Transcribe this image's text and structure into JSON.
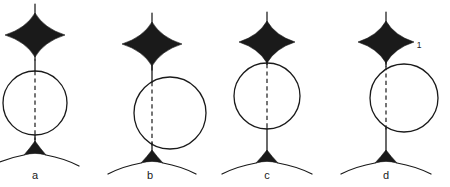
{
  "figure": {
    "background_color": "#ffffff",
    "ink_color": "#1a1a1a",
    "width": 450,
    "height": 187,
    "panel_count": 4
  },
  "panels": [
    {
      "id": "panel-a",
      "label": "a",
      "label_x": 35,
      "label_y": 179,
      "axis_x": 35,
      "star": {
        "name": "four-pointed-star",
        "center_x": 35,
        "center_y": 35,
        "h_radius": 30,
        "v_radius": 22,
        "tail_top_y": 4,
        "tail_bottom_y": 60
      },
      "circle": {
        "name": "circle",
        "center_x": 35,
        "center_y": 103,
        "radius": 32,
        "offset_from_axis": 0
      },
      "dashed_chord": {
        "x": 35,
        "y_top": 71,
        "y_bottom": 140
      },
      "stem_upper": {
        "x": 35,
        "y_top": 60,
        "y_bottom": 71
      },
      "stem_lower": {
        "x": 35,
        "y_top": 135,
        "y_bottom": 143
      },
      "tripod": {
        "name": "tripod-foot",
        "apex_x": 35,
        "apex_y": 141,
        "base_y": 155,
        "base_half_width": 11,
        "wing_span": 33,
        "wing_drop": 11
      },
      "mark": null
    },
    {
      "id": "panel-b",
      "label": "b",
      "label_x": 150,
      "label_y": 179,
      "axis_x": 152,
      "star": {
        "name": "four-pointed-star",
        "center_x": 152,
        "center_y": 44,
        "h_radius": 30,
        "v_radius": 22,
        "tail_top_y": 13,
        "tail_bottom_y": 70
      },
      "circle": {
        "name": "circle",
        "center_x": 170,
        "center_y": 113,
        "radius": 36,
        "offset_from_axis": 18
      },
      "dashed_chord": {
        "x": 152,
        "y_top": 82,
        "y_bottom": 148
      },
      "stem_upper": {
        "x": 152,
        "y_top": 66,
        "y_bottom": 82
      },
      "stem_lower": {
        "x": 152,
        "y_top": 143,
        "y_bottom": 152
      },
      "tripod": {
        "name": "tripod-foot",
        "apex_x": 152,
        "apex_y": 150,
        "base_y": 163,
        "base_half_width": 11,
        "wing_span": 33,
        "wing_drop": 11
      },
      "mark": null
    },
    {
      "id": "panel-c",
      "label": "c",
      "label_x": 267,
      "label_y": 179,
      "axis_x": 267,
      "star": {
        "name": "four-pointed-star",
        "center_x": 267,
        "center_y": 42,
        "h_radius": 28,
        "v_radius": 21,
        "tail_top_y": 12,
        "tail_bottom_y": 64
      },
      "circle": {
        "name": "circle",
        "center_x": 267,
        "center_y": 96,
        "radius": 33,
        "offset_from_axis": 0
      },
      "dashed_chord": {
        "x": 267,
        "y_top": 64,
        "y_bottom": 128
      },
      "stem_upper": {
        "x": 267,
        "y_top": 60,
        "y_bottom": 64
      },
      "stem_lower": {
        "x": 267,
        "y_top": 128,
        "y_bottom": 152
      },
      "tripod": {
        "name": "tripod-foot",
        "apex_x": 267,
        "apex_y": 150,
        "base_y": 163,
        "base_half_width": 11,
        "wing_span": 34,
        "wing_drop": 11
      },
      "mark": null
    },
    {
      "id": "panel-d",
      "label": "d",
      "label_x": 386,
      "label_y": 179,
      "axis_x": 386,
      "star": {
        "name": "four-pointed-star",
        "center_x": 386,
        "center_y": 42,
        "h_radius": 28,
        "v_radius": 21,
        "tail_top_y": 12,
        "tail_bottom_y": 64
      },
      "circle": {
        "name": "circle",
        "center_x": 404,
        "center_y": 98,
        "radius": 34,
        "offset_from_axis": 18
      },
      "dashed_chord": {
        "x": 386,
        "y_top": 66,
        "y_bottom": 130
      },
      "stem_upper": {
        "x": 386,
        "y_top": 60,
        "y_bottom": 66
      },
      "stem_lower": {
        "x": 386,
        "y_top": 128,
        "y_bottom": 152
      },
      "tripod": {
        "name": "tripod-foot",
        "apex_x": 386,
        "apex_y": 150,
        "base_y": 163,
        "base_half_width": 11,
        "wing_span": 34,
        "wing_drop": 11
      },
      "mark": {
        "name": "callout-1",
        "text": "1",
        "x": 419,
        "y": 48
      }
    }
  ]
}
